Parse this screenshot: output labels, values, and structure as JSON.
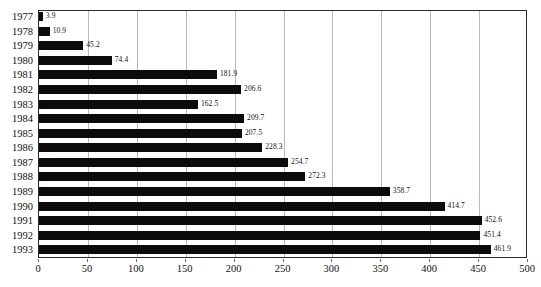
{
  "chart_data": {
    "type": "bar",
    "orientation": "horizontal",
    "title": "",
    "subtitle": "",
    "xlabel": "",
    "ylabel": "",
    "xlim": [
      0,
      500
    ],
    "xticks": [
      0,
      50,
      100,
      150,
      200,
      250,
      300,
      350,
      400,
      450,
      500
    ],
    "grid": true,
    "grid_axis": "x",
    "legend": false,
    "legend_position": "none",
    "bar_color": "#0b0b0b",
    "gridline_color": "#b9b9b9",
    "axis_color": "#2b2b2b",
    "data_labels": true,
    "categories": [
      "1977",
      "1978",
      "1979",
      "1980",
      "1981",
      "1982",
      "1983",
      "1984",
      "1985",
      "1986",
      "1987",
      "1988",
      "1989",
      "1990",
      "1991",
      "1992",
      "1993"
    ],
    "values": [
      3.9,
      10.9,
      45.2,
      74.4,
      181.9,
      206.6,
      162.5,
      209.7,
      207.5,
      228.3,
      254.7,
      272.3,
      358.7,
      414.7,
      452.6,
      451.4,
      461.9
    ],
    "value_labels": [
      "3.9",
      "10.9",
      "45.2",
      "74.4",
      "181.9",
      "206.6",
      "162.5",
      "209.7",
      "207.5",
      "228.3",
      "254.7",
      "272.3",
      "358.7",
      "414.7",
      "452.6",
      "451.4",
      "461.9"
    ]
  }
}
